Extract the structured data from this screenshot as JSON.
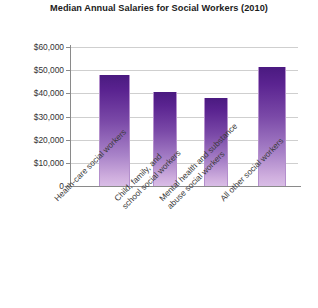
{
  "chart_data": {
    "type": "bar",
    "title": "Median Annual Salaries for Social Workers (2010)",
    "xlabel": "",
    "ylabel": "",
    "ylim": [
      0,
      60000
    ],
    "ytick_values": [
      0,
      10000,
      20000,
      30000,
      40000,
      50000,
      60000
    ],
    "ytick_labels": [
      "0",
      "$10,000",
      "$20,000",
      "$30,000",
      "$40,000",
      "$50,000",
      "$60,000"
    ],
    "grid": true,
    "legend": "none",
    "categories": [
      "Health-care social workers",
      "Child, family, and school social workers",
      "Mental health and substance abuse social workers",
      "All other social workers"
    ],
    "category_lines": [
      [
        "Health-care social workers"
      ],
      [
        "Child, family, and",
        "school social workers"
      ],
      [
        "Mental health and substance",
        "abuse social workers"
      ],
      [
        "All other social workers"
      ]
    ],
    "values": [
      48000,
      40500,
      38200,
      51500
    ],
    "bar_colors": {
      "gradient_top": "#4a1a80",
      "gradient_bottom": "#d9bde6",
      "outline": "#b48fcc"
    },
    "axis_color": "#8a8a8a",
    "gridline_color": "#cfcfcf",
    "background": "#ffffff"
  }
}
